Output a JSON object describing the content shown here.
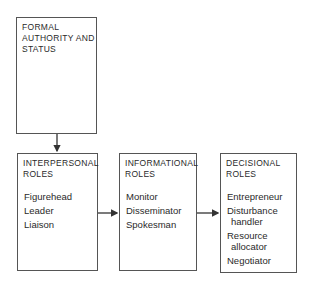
{
  "boxes": {
    "authority": {
      "title_lines": [
        "FORMAL",
        "AUTHORITY AND",
        "STATUS"
      ]
    },
    "interpersonal": {
      "title_lines": [
        "INTERPERSONAL",
        "ROLES"
      ],
      "items": [
        "Figurehead",
        "Leader",
        "Liaison"
      ]
    },
    "informational": {
      "title_lines": [
        "INFORMATIONAL",
        "ROLES"
      ],
      "items": [
        "Monitor",
        "Disseminator",
        "Spokesman"
      ]
    },
    "decisional": {
      "title_lines": [
        "DECISIONAL",
        "ROLES"
      ],
      "items": [
        "Entrepreneur",
        "Disturbance",
        "handler",
        "Resource",
        "allocator",
        "Negotiator"
      ]
    }
  },
  "colors": {
    "line": "#333333",
    "text": "#2a2a2a"
  }
}
